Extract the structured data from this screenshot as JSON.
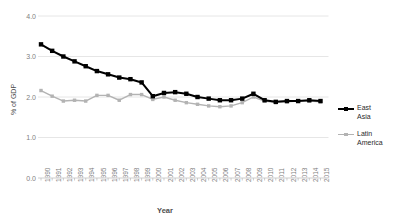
{
  "chart_data": {
    "type": "line",
    "title": "",
    "xlabel": "Year",
    "ylabel": "% of GDP",
    "ylim": [
      0.0,
      4.0
    ],
    "yticks": [
      "0.0",
      "1.0",
      "2.0",
      "3.0",
      "4.0"
    ],
    "ytick_values": [
      0.0,
      1.0,
      2.0,
      3.0,
      4.0
    ],
    "grid": true,
    "legend_position": "right",
    "categories": [
      "1990",
      "1991",
      "1992",
      "1993",
      "1994",
      "1995",
      "1996",
      "1997",
      "1998",
      "1999",
      "2000",
      "2001",
      "2002",
      "2003",
      "2004",
      "2005",
      "2006",
      "2007",
      "2008",
      "2009",
      "2010",
      "2011",
      "2012",
      "2013",
      "2014",
      "2015"
    ],
    "series": [
      {
        "name": "East Asia",
        "color": "#000000",
        "marker": "square",
        "values": [
          3.3,
          3.14,
          3.0,
          2.88,
          2.76,
          2.64,
          2.56,
          2.48,
          2.44,
          2.36,
          2.02,
          2.1,
          2.12,
          2.08,
          2.0,
          1.96,
          1.92,
          1.92,
          1.96,
          2.08,
          1.92,
          1.88,
          1.9,
          1.9,
          1.92,
          1.9
        ]
      },
      {
        "name": "Latin America",
        "color": "#b3b3b3",
        "marker": "square",
        "values": [
          2.16,
          2.02,
          1.9,
          1.92,
          1.9,
          2.04,
          2.04,
          1.92,
          2.06,
          2.06,
          1.94,
          2.0,
          1.92,
          1.86,
          1.82,
          1.78,
          1.76,
          1.78,
          1.86,
          2.0,
          1.9,
          1.86,
          1.88,
          1.9,
          1.9,
          1.88
        ]
      }
    ]
  },
  "legend": {
    "entries": [
      {
        "label": "East Asia"
      },
      {
        "label": "Latin\nAmerica"
      }
    ]
  },
  "axes": {
    "x_title": "Year",
    "y_title": "% of GDP"
  }
}
